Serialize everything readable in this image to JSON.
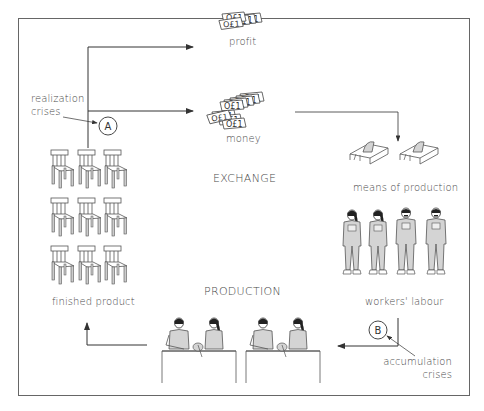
{
  "diagram": {
    "sections": {
      "exchange": "EXCHANGE",
      "production": "PRODUCTION"
    },
    "nodes": {
      "profit": "profit",
      "money": "money",
      "means_of_production": "means of production",
      "workers_labour": "workers' labour",
      "finished_product": "finished product"
    },
    "crises": {
      "a": {
        "marker": "A",
        "label_line1": "realization",
        "label_line2": "crises"
      },
      "b": {
        "marker": "B",
        "label_line1": "accumulation",
        "label_line2": "crises"
      }
    },
    "icons": {
      "profit": "banknotes-small-stack-icon",
      "money": "banknotes-large-stack-icon",
      "means_of_production": "table-saw-icon",
      "workers_labour": "worker-in-overalls-icon",
      "production": "workers-at-bench-icon",
      "finished_product": "chair-icon"
    },
    "colors": {
      "line": "#444444",
      "fill_grey": "#d4d4d4",
      "frame": "#666666"
    }
  }
}
